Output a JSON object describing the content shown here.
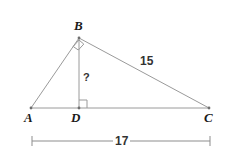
{
  "figure": {
    "type": "geometry-diagram",
    "background_color": "#ffffff",
    "stroke_color": "#9a9a9a",
    "label_color": "#1a1a1a",
    "measure_color": "#333333",
    "vertices": [
      {
        "name": "A",
        "label": "A",
        "x": 31,
        "y": 108,
        "label_x": 24,
        "label_y": 112
      },
      {
        "name": "B",
        "label": "B",
        "x": 79,
        "y": 38,
        "label_x": 74,
        "label_y": 19
      },
      {
        "name": "C",
        "label": "C",
        "x": 209,
        "y": 108,
        "label_x": 205,
        "label_y": 112
      },
      {
        "name": "D",
        "label": "D",
        "x": 79,
        "y": 108,
        "label_x": 72,
        "label_y": 112
      }
    ],
    "segments": [
      {
        "name": "AB",
        "from": "A",
        "to": "B"
      },
      {
        "name": "BC",
        "from": "B",
        "to": "C"
      },
      {
        "name": "AC",
        "from": "A",
        "to": "C"
      },
      {
        "name": "BD",
        "from": "B",
        "to": "D"
      }
    ],
    "right_angles": [
      {
        "name": "angle-ABC",
        "at": "B",
        "size": 9
      },
      {
        "name": "angle-BDC",
        "at": "D",
        "size": 8
      }
    ],
    "side_labels": [
      {
        "name": "label-bc",
        "text": "15",
        "x": 138,
        "y": 55
      },
      {
        "name": "label-bd-unknown",
        "text": "?",
        "x": 83,
        "y": 72
      }
    ],
    "dimension": {
      "name": "dimension-ac",
      "text": "17",
      "x1": 32,
      "x2": 210,
      "y": 141,
      "tick_half_height": 5,
      "label_x": 120,
      "label_y": 141
    }
  }
}
